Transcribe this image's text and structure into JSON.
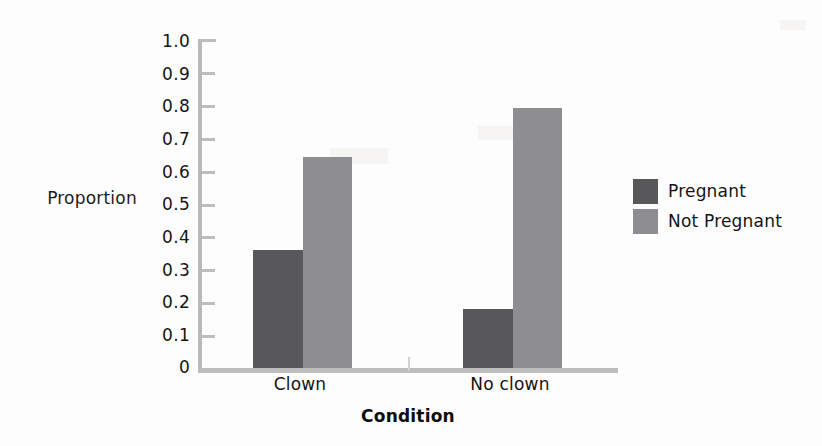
{
  "chart_data": {
    "type": "bar",
    "title": "",
    "xlabel": "Condition",
    "ylabel": "Proportion",
    "categories": [
      "Clown",
      "No clown"
    ],
    "series": [
      {
        "name": "Pregnant",
        "values": [
          0.36,
          0.18
        ],
        "color": "#58585a"
      },
      {
        "name": "Not Pregnant",
        "values": [
          0.64,
          0.79
        ],
        "color": "#8e8e90"
      }
    ],
    "ylim": [
      0,
      1.0
    ],
    "ytick_labels": [
      "1.0",
      "0.9",
      "0.8",
      "0.7",
      "0.6",
      "0.5",
      "0.4",
      "0.3",
      "0.2",
      "0.1",
      "0"
    ],
    "ytick_values": [
      1.0,
      0.9,
      0.8,
      0.7,
      0.6,
      0.5,
      0.4,
      0.3,
      0.2,
      0.1,
      0
    ],
    "grid": false,
    "legend_position": "right",
    "legend_entries": [
      "Pregnant",
      "Not Pregnant"
    ],
    "bar_group_gap": true,
    "axis_color": "#bdbdbd",
    "background_color": "#fdfdfd"
  },
  "axes": {
    "ylabel": "Proportion",
    "xlabel": "Condition"
  },
  "legend": {
    "entries": [
      {
        "label": "Pregnant",
        "color": "#58585a"
      },
      {
        "label": "Not Pregnant",
        "color": "#8e8e90"
      }
    ]
  }
}
